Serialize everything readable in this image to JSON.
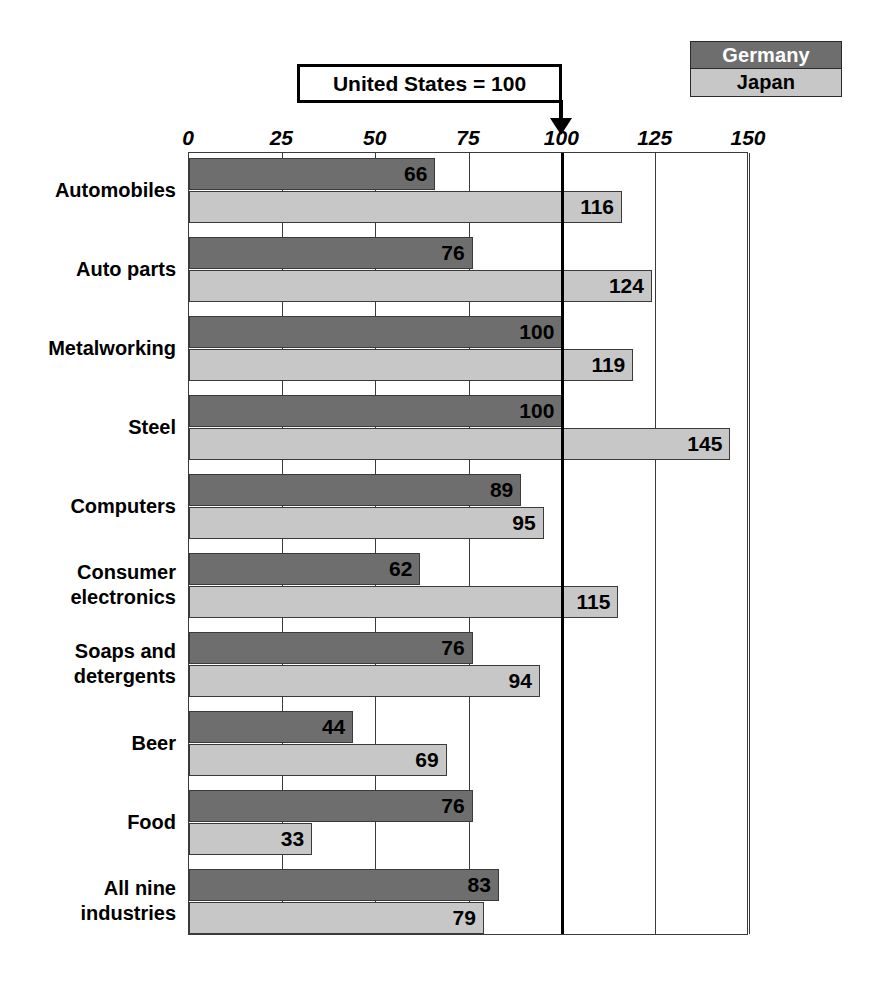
{
  "legend": {
    "items": [
      {
        "label": "Germany",
        "color": "#6e6e6e",
        "text_color": "#ffffff"
      },
      {
        "label": "Japan",
        "color": "#c7c7c7",
        "text_color": "#000000"
      }
    ]
  },
  "callout": {
    "text": "United States = 100",
    "points_to_value": 100
  },
  "chart_data": {
    "type": "bar",
    "orientation": "horizontal",
    "title": "",
    "subtitle": "",
    "xlabel": "",
    "ylabel": "",
    "xlim": [
      0,
      150
    ],
    "xticks": [
      0,
      25,
      50,
      75,
      100,
      125,
      150
    ],
    "xtick_labels": [
      "0",
      "25",
      "50",
      "75",
      "100",
      "125",
      "150"
    ],
    "grid": true,
    "legend_position": "top-right",
    "reference_line": {
      "value": 100,
      "label": "United States = 100",
      "color": "#000000"
    },
    "categories": [
      "Automobiles",
      "Auto parts",
      "Metalworking",
      "Steel",
      "Computers",
      "Consumer electronics",
      "Soaps and detergents",
      "Beer",
      "Food",
      "All nine industries"
    ],
    "category_lines": [
      [
        "Automobiles"
      ],
      [
        "Auto parts"
      ],
      [
        "Metalworking"
      ],
      [
        "Steel"
      ],
      [
        "Computers"
      ],
      [
        "Consumer",
        "electronics"
      ],
      [
        "Soaps and",
        "detergents"
      ],
      [
        "Beer"
      ],
      [
        "Food"
      ],
      [
        "All nine",
        "industries"
      ]
    ],
    "series": [
      {
        "name": "Germany",
        "color": "#6e6e6e",
        "values": [
          66,
          76,
          100,
          100,
          89,
          62,
          76,
          44,
          76,
          83
        ]
      },
      {
        "name": "Japan",
        "color": "#c7c7c7",
        "values": [
          116,
          124,
          119,
          145,
          95,
          115,
          94,
          69,
          33,
          79
        ]
      }
    ]
  }
}
